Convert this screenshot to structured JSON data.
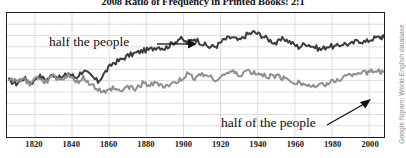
{
  "figure": {
    "attribution": "Google Ngram: World English database"
  },
  "chart_data": {
    "type": "line",
    "title": "2008 Ratio of Frequency in Printed Books: 2:1",
    "xlabel": "",
    "ylabel": "",
    "grid": true,
    "legend_position": "inline-annotations",
    "xlim": [
      1805,
      2008
    ],
    "ylim": [
      0,
      10
    ],
    "xticks": [
      1820,
      1840,
      1860,
      1880,
      1900,
      1920,
      1940,
      1960,
      1980,
      2000
    ],
    "ytick_count": 11,
    "annotations": [
      {
        "text": "half the people",
        "series": "half the people",
        "arrow": "right"
      },
      {
        "text": "half of the people",
        "series": "half of the people",
        "arrow": "up-right"
      }
    ],
    "colors": {
      "series_dark": "#3c3c3c",
      "series_gray": "#8f8f8f",
      "grid": "#d9d9d9",
      "frame": "#1d1d1d",
      "background": "#ffffff",
      "attribution_text": "#8d8d8d"
    },
    "x": [
      1806,
      1810,
      1814,
      1818,
      1822,
      1826,
      1830,
      1834,
      1838,
      1842,
      1846,
      1850,
      1854,
      1858,
      1862,
      1866,
      1870,
      1874,
      1878,
      1882,
      1886,
      1890,
      1894,
      1898,
      1902,
      1906,
      1910,
      1914,
      1918,
      1922,
      1926,
      1930,
      1934,
      1938,
      1942,
      1946,
      1950,
      1954,
      1958,
      1962,
      1966,
      1970,
      1974,
      1978,
      1982,
      1986,
      1990,
      1994,
      1998,
      2002,
      2006,
      2008
    ],
    "series": [
      {
        "name": "half the people",
        "color": "#3c3c3c",
        "values": [
          4.55,
          4.3,
          4.75,
          4.35,
          4.95,
          4.6,
          5.05,
          4.7,
          5.15,
          4.8,
          5.35,
          4.95,
          4.45,
          5.25,
          5.95,
          6.2,
          6.55,
          6.75,
          6.95,
          7.05,
          7.3,
          7.15,
          7.55,
          7.95,
          7.6,
          7.95,
          7.55,
          7.25,
          7.35,
          7.85,
          8.05,
          7.75,
          8.25,
          8.45,
          8.2,
          7.85,
          7.55,
          7.95,
          7.6,
          7.25,
          7.55,
          7.3,
          7.05,
          7.35,
          7.25,
          7.55,
          7.45,
          7.8,
          7.65,
          7.95,
          8.05,
          8.05
        ]
      },
      {
        "name": "half of the people",
        "color": "#8f8f8f",
        "values": [
          4.7,
          4.45,
          4.6,
          4.25,
          4.85,
          4.45,
          4.95,
          4.55,
          5.05,
          4.35,
          4.75,
          4.25,
          3.85,
          3.55,
          3.95,
          3.65,
          4.1,
          3.85,
          4.3,
          4.15,
          4.35,
          4.05,
          4.25,
          4.55,
          5.05,
          4.75,
          5.15,
          4.85,
          4.65,
          5.05,
          5.25,
          4.95,
          5.35,
          5.15,
          5.05,
          4.85,
          4.95,
          4.75,
          4.55,
          4.35,
          4.25,
          4.05,
          4.15,
          4.35,
          4.55,
          4.85,
          5.05,
          5.25,
          5.15,
          5.35,
          5.25,
          5.25
        ]
      }
    ]
  },
  "annotations": {
    "dark_label": "half the people",
    "gray_label": "half of the people"
  }
}
